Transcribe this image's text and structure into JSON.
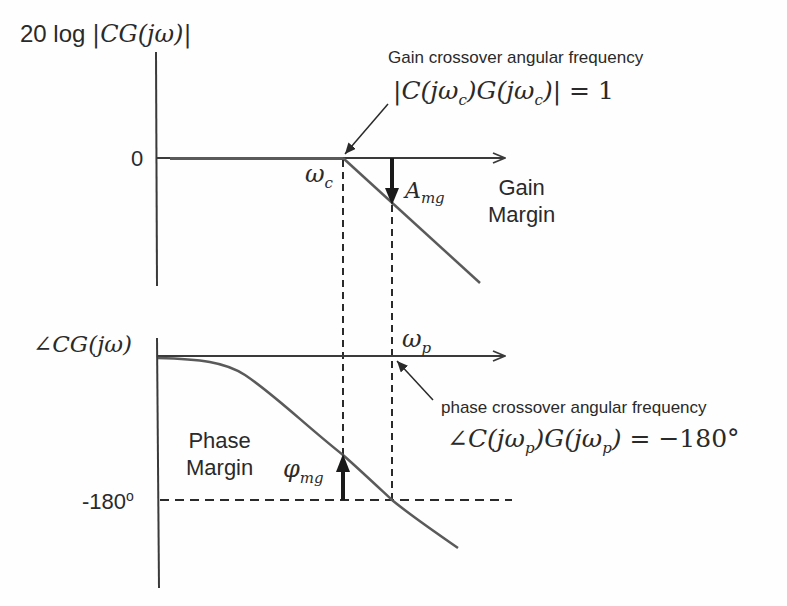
{
  "magnitude_plot": {
    "y_axis_label_prefix": "20 log ",
    "y_axis_label_math": "|CG(jω)|",
    "zero_tick": "0",
    "crossover_symbol": "ωc",
    "gain_margin_symbol": "Amg",
    "gain_margin_label_line1": "Gain",
    "gain_margin_label_line2": "Margin",
    "annotation_title": "Gain crossover angular frequency",
    "annotation_equation": "|C(jωc)G(jωc)| = 1"
  },
  "phase_plot": {
    "y_axis_label_math": "∠CG(jω)",
    "minus180_tick": "-180°",
    "crossover_symbol": "ωp",
    "phase_margin_symbol": "φmg",
    "phase_margin_label_line1": "Phase",
    "phase_margin_label_line2": "Margin",
    "annotation_title": "phase crossover angular frequency",
    "annotation_equation": "∠C(jωp)G(jωp) = −180°"
  },
  "colors": {
    "axis": "#3a3a3a",
    "curve": "#5a5a5a",
    "text": "#2a2a2a",
    "arrow": "#1a1a1a"
  }
}
